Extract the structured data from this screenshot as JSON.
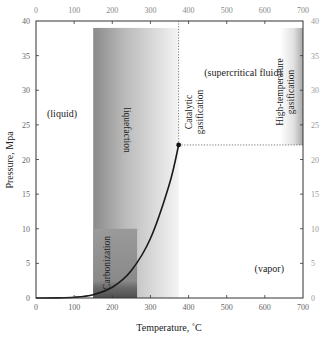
{
  "chart_data": {
    "type": "line",
    "title": "",
    "xlabel": "Temperature, ˚C",
    "ylabel": "Pressure, Mpa",
    "xlim": [
      0,
      700
    ],
    "ylim": [
      0,
      40
    ],
    "x_ticks": [
      0,
      100,
      200,
      300,
      400,
      500,
      600,
      700
    ],
    "y_ticks": [
      0,
      5,
      10,
      15,
      20,
      25,
      30,
      35,
      40
    ],
    "secondary_axes": {
      "top_x_ticks": [
        0,
        100,
        200,
        300,
        400,
        500,
        600,
        700
      ],
      "right_y_ticks": [
        0,
        5,
        10,
        15,
        20,
        25,
        30,
        35,
        40
      ]
    },
    "grid": false,
    "series": [
      {
        "name": "Vapor pressure curve of water",
        "x": [
          0,
          50,
          100,
          150,
          200,
          250,
          300,
          350,
          374
        ],
        "y": [
          0.0006,
          0.012,
          0.101,
          0.48,
          1.55,
          3.98,
          8.59,
          16.5,
          22.1
        ]
      }
    ],
    "critical_point": {
      "x": 374,
      "y": 22.1
    },
    "reference_lines": [
      {
        "orientation": "vertical",
        "x": 374,
        "y_range": [
          22.1,
          40
        ],
        "style": "dotted"
      },
      {
        "orientation": "horizontal",
        "y": 22.1,
        "x_range": [
          374,
          700
        ],
        "style": "dotted"
      }
    ],
    "shaded_regions": [
      {
        "name": "liquefaction",
        "x_range": [
          150,
          374
        ],
        "y_range": [
          0,
          39
        ],
        "fill": "gradient gray dark-to-light"
      },
      {
        "name": "carbonization",
        "x_range": [
          150,
          265
        ],
        "y_range": [
          0,
          10
        ],
        "fill": "darker gray"
      },
      {
        "name": "high-temperature gasification",
        "x_range": [
          640,
          700
        ],
        "y_range": [
          22.1,
          39
        ],
        "fill": "gradient gray light-to-dark"
      }
    ],
    "annotations": [
      {
        "text": "(liquid)",
        "x": 70,
        "y": 27
      },
      {
        "text": "(supercritical fluid)",
        "x": 540,
        "y": 36.5
      },
      {
        "text": "(vapor)",
        "x": 630,
        "y": 4
      },
      {
        "text": "liquefaction",
        "x": 240,
        "y": 22,
        "rotation": 90
      },
      {
        "text": "Carbonization",
        "x": 195,
        "y": 5,
        "rotation": -90
      },
      {
        "text": "Catalytic gasification",
        "x": 400,
        "y": 27,
        "rotation": -90
      },
      {
        "text": "High-temperature gasification",
        "x": 665,
        "y": 29,
        "rotation": -90
      }
    ]
  },
  "labels": {
    "xlabel": "Temperature, ˚C",
    "ylabel": "Pressure, Mpa",
    "liquid": "(liquid)",
    "supercritical": "(supercritical fluid)",
    "vapor": "(vapor)",
    "liquefaction": "liquefaction",
    "carbonization": "Carbonization",
    "catalytic_1": "Catalytic",
    "catalytic_2": "gasification",
    "hightemp_1": "High-temperature",
    "hightemp_2": "gasification"
  }
}
